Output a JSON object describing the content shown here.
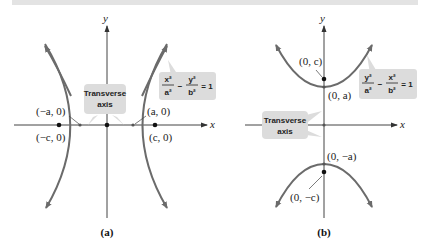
{
  "colors": {
    "curve": "#6b6b6b",
    "axis": "#444444",
    "callout_bg": "#dcdcdc",
    "top_band": "#e3e3e3"
  },
  "panel_a": {
    "caption": "(a)",
    "axis_y": "y",
    "axis_x": "x",
    "equation": {
      "term1_num": "x²",
      "term1_den": "a²",
      "minus": "−",
      "term2_num": "y²",
      "term2_den": "b²",
      "rhs": "= 1"
    },
    "callout": {
      "line1": "Transverse",
      "line2": "axis"
    },
    "points": {
      "neg_a": "(−a, 0)",
      "pos_a": "(a, 0)",
      "neg_c": "(−c, 0)",
      "pos_c": "(c, 0)"
    }
  },
  "panel_b": {
    "caption": "(b)",
    "axis_y": "y",
    "axis_x": "x",
    "equation": {
      "term1_num": "y²",
      "term1_den": "a²",
      "minus": "−",
      "term2_num": "x²",
      "term2_den": "b²",
      "rhs": "= 1"
    },
    "callout": {
      "line1": "Transverse",
      "line2": "axis"
    },
    "points": {
      "pos_c": "(0, c)",
      "pos_a": "(0, a)",
      "neg_a": "(0, −a)",
      "neg_c": "(0, −c)"
    }
  }
}
